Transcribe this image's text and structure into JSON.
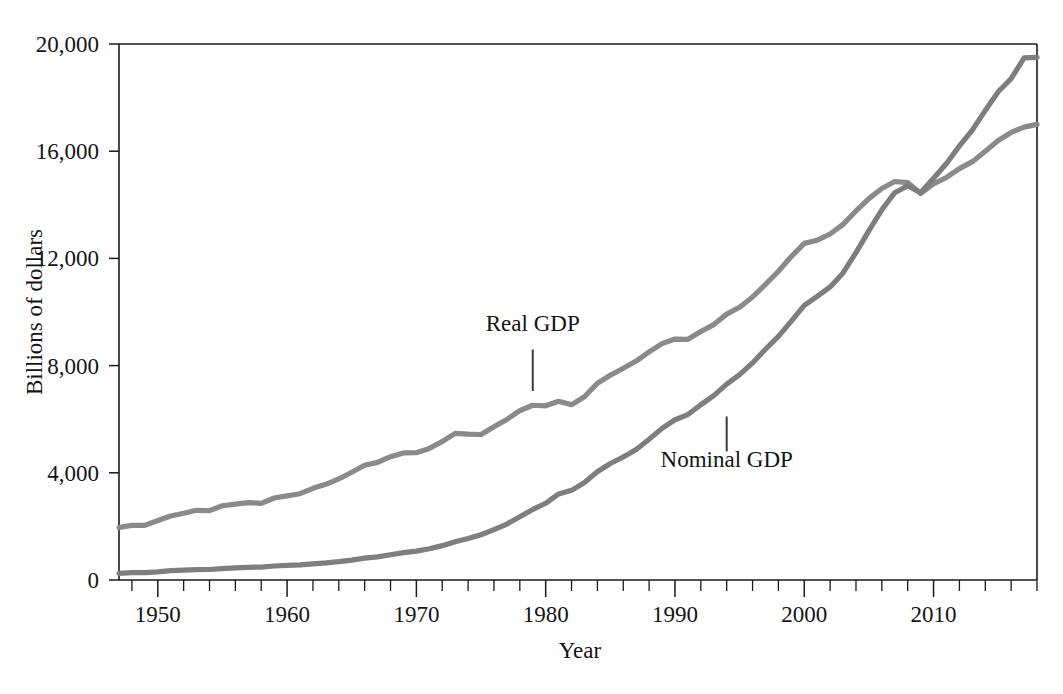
{
  "chart_data": {
    "type": "line",
    "title": "",
    "xlabel": "Year",
    "ylabel": "Billions of dollars",
    "xlim": [
      1947,
      2018
    ],
    "ylim": [
      0,
      20000
    ],
    "grid": false,
    "legend_position": "inline-annotations",
    "y_ticks": [
      0,
      4000,
      8000,
      12000,
      16000,
      20000
    ],
    "y_tick_labels": [
      "0",
      "4,000",
      "8,000",
      "12,000",
      "16,000",
      "20,000"
    ],
    "x_ticks": [
      1950,
      1960,
      1970,
      1980,
      1990,
      2000,
      2010
    ],
    "x_tick_labels": [
      "1950",
      "1960",
      "1970",
      "1980",
      "1990",
      "2000",
      "2010"
    ],
    "x_minor_tick_interval": 2,
    "series_colors": {
      "real_gdp": "#8a8a8a",
      "nominal_gdp": "#7e7e7e"
    },
    "annotations": [
      {
        "text": "Real GDP",
        "label_x": 1979,
        "label_y": 9300,
        "leader_from_y": 8600,
        "leader_to_y": 7050
      },
      {
        "text": "Nominal GDP",
        "label_x": 1994,
        "label_y": 4200,
        "leader_from_y": 6100,
        "leader_to_y": 4800
      }
    ],
    "x": [
      1947,
      1948,
      1949,
      1950,
      1951,
      1952,
      1953,
      1954,
      1955,
      1956,
      1957,
      1958,
      1959,
      1960,
      1961,
      1962,
      1963,
      1964,
      1965,
      1966,
      1967,
      1968,
      1969,
      1970,
      1971,
      1972,
      1973,
      1974,
      1975,
      1976,
      1977,
      1978,
      1979,
      1980,
      1981,
      1982,
      1983,
      1984,
      1985,
      1986,
      1987,
      1988,
      1989,
      1990,
      1991,
      1992,
      1993,
      1994,
      1995,
      1996,
      1997,
      1998,
      1999,
      2000,
      2001,
      2002,
      2003,
      2004,
      2005,
      2006,
      2007,
      2008,
      2009,
      2010,
      2011,
      2012,
      2013,
      2014,
      2015,
      2016,
      2017,
      2018
    ],
    "series": [
      {
        "name": "Real GDP",
        "color": "#8a8a8a",
        "values": [
          1960,
          2040,
          2040,
          2220,
          2390,
          2490,
          2600,
          2590,
          2770,
          2830,
          2890,
          2860,
          3060,
          3140,
          3220,
          3420,
          3570,
          3770,
          4020,
          4280,
          4390,
          4600,
          4740,
          4750,
          4910,
          5170,
          5470,
          5440,
          5430,
          5720,
          5990,
          6320,
          6520,
          6500,
          6670,
          6540,
          6840,
          7340,
          7640,
          7900,
          8170,
          8510,
          8820,
          8990,
          8980,
          9270,
          9530,
          9920,
          10180,
          10560,
          11030,
          11520,
          12070,
          12560,
          12680,
          12910,
          13270,
          13770,
          14230,
          14610,
          14870,
          14830,
          14420,
          14780,
          15020,
          15350,
          15610,
          16000,
          16400,
          16700,
          16900,
          17000
        ]
      },
      {
        "name": "Nominal GDP",
        "color": "#7e7e7e",
        "values": [
          250,
          275,
          273,
          300,
          347,
          368,
          389,
          391,
          426,
          450,
          474,
          482,
          522,
          543,
          563,
          605,
          639,
          686,
          744,
          815,
          862,
          943,
          1020,
          1076,
          1168,
          1282,
          1429,
          1549,
          1689,
          1878,
          2086,
          2357,
          2632,
          2863,
          3211,
          3345,
          3638,
          4041,
          4347,
          4590,
          4870,
          5253,
          5658,
          5980,
          6174,
          6539,
          6879,
          7309,
          7664,
          8100,
          8609,
          9089,
          9661,
          10250,
          10582,
          10936,
          11458,
          12214,
          13037,
          13815,
          14452,
          14713,
          14449,
          14992,
          15543,
          16197,
          16785,
          17522,
          18219,
          18707,
          19485,
          19500
        ]
      }
    ]
  },
  "axis": {
    "y_label": "Billions of dollars",
    "x_label": "Year"
  }
}
